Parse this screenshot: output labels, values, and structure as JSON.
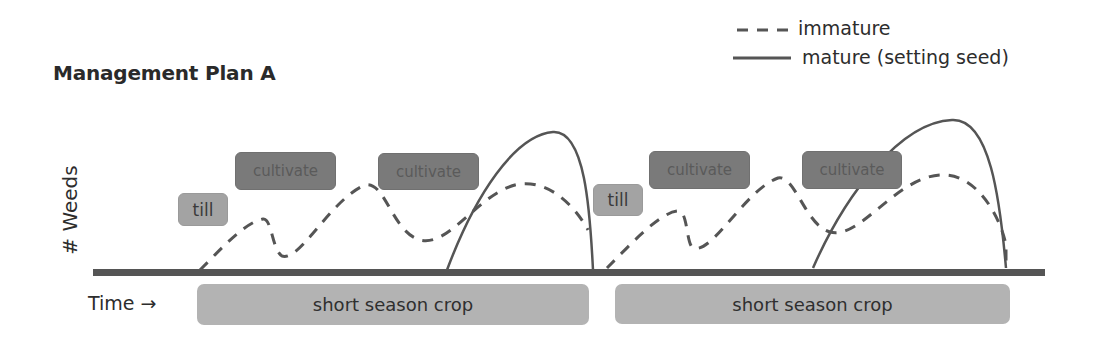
{
  "title": "Management Plan A",
  "legend": {
    "items": [
      {
        "label": "immature",
        "style": "dashed"
      },
      {
        "label": "mature (setting seed)",
        "style": "solid"
      }
    ]
  },
  "axes": {
    "ylabel": "# Weeds",
    "xlabel": "Time →"
  },
  "actions": [
    {
      "label": "till",
      "kind": "till"
    },
    {
      "label": "cultivate",
      "kind": "cultivate"
    },
    {
      "label": "cultivate",
      "kind": "cultivate"
    },
    {
      "label": "till",
      "kind": "till"
    },
    {
      "label": "cultivate",
      "kind": "cultivate"
    },
    {
      "label": "cultivate",
      "kind": "cultivate"
    }
  ],
  "crops": [
    {
      "label": "short season crop"
    },
    {
      "label": "short season crop"
    }
  ],
  "colors": {
    "line": "#555555",
    "axis": "#555555",
    "till_box": "#a3a3a3",
    "cultivate_box": "#7a7a7a",
    "crop_box": "#b3b3b3"
  }
}
